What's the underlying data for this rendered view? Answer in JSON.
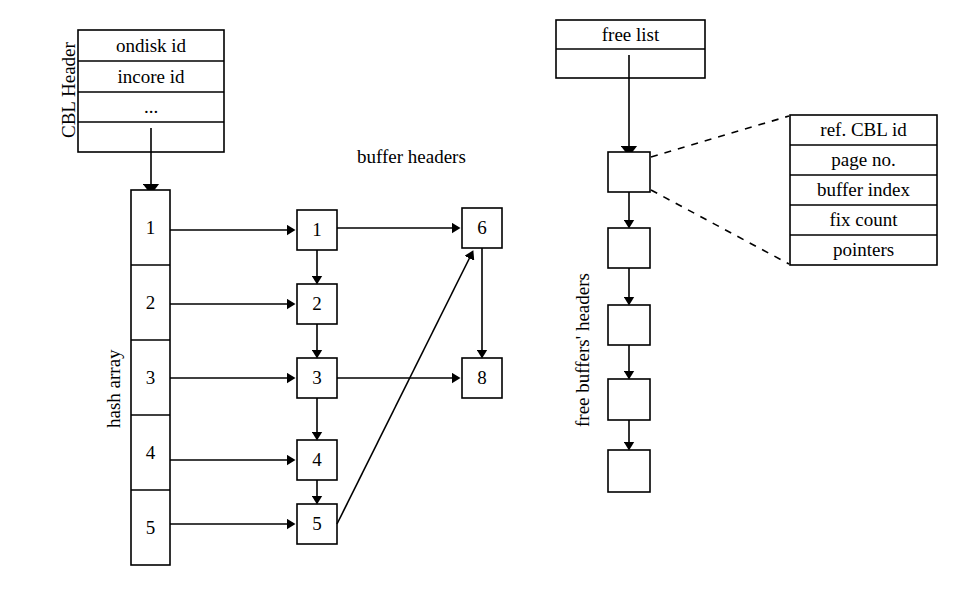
{
  "cbl_header": {
    "side_label": "CBL Header",
    "rows": [
      "ondisk id",
      "incore id",
      "...",
      ""
    ]
  },
  "hash_array": {
    "side_label": "hash array",
    "cells": [
      "1",
      "2",
      "3",
      "4",
      "5"
    ]
  },
  "buffer_headers": {
    "section_label": "buffer headers",
    "chain_nodes": [
      "1",
      "2",
      "3",
      "4",
      "5"
    ],
    "right_nodes": [
      "6",
      "8"
    ]
  },
  "free_list": {
    "title": "free list",
    "empty_row": "",
    "side_label": "free buffers' headers",
    "nodes": [
      "",
      "",
      "",
      "",
      ""
    ]
  },
  "buffer_detail": {
    "rows": [
      "ref. CBL id",
      "page no.",
      "buffer index",
      "fix count",
      "pointers"
    ]
  },
  "style": {
    "stroke": "#000000",
    "fill": "#ffffff"
  }
}
